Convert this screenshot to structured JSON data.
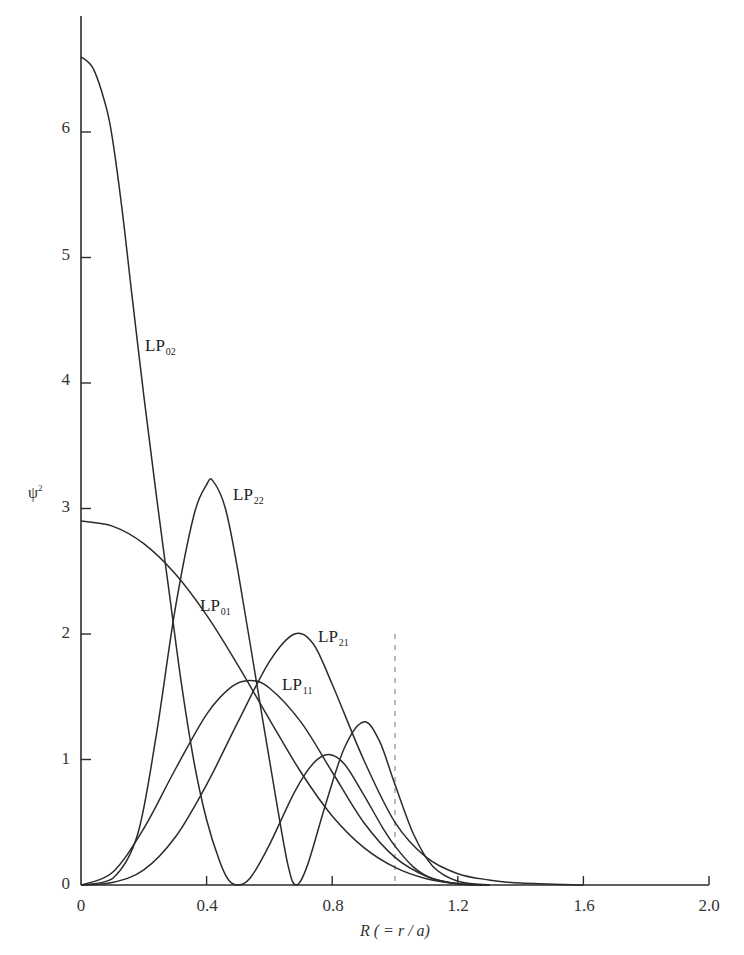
{
  "chart_data": {
    "type": "line",
    "title": "",
    "xlabel": "R (= r/a)",
    "ylabel": "ψ²",
    "xlim": [
      0,
      2.0
    ],
    "ylim": [
      0,
      6.6
    ],
    "grid": false,
    "legend": "inline labels",
    "x_ticks": [
      "0",
      "0.4",
      "0.8",
      "1.2",
      "1.6",
      "2.0"
    ],
    "y_ticks": [
      "0",
      "1",
      "2",
      "3",
      "4",
      "5",
      "6"
    ],
    "annotations": [
      {
        "type": "dashed-vertical-line",
        "x": 1.0,
        "y_top": 2.0,
        "meaning": "core boundary R = 1"
      }
    ],
    "series": [
      {
        "name": "LP01",
        "label_main": "LP",
        "label_sub": "01",
        "points": [
          [
            0,
            2.9
          ],
          [
            0.1,
            2.86
          ],
          [
            0.2,
            2.72
          ],
          [
            0.3,
            2.48
          ],
          [
            0.4,
            2.15
          ],
          [
            0.5,
            1.75
          ],
          [
            0.6,
            1.32
          ],
          [
            0.7,
            0.9
          ],
          [
            0.8,
            0.55
          ],
          [
            0.9,
            0.3
          ],
          [
            1.0,
            0.14
          ],
          [
            1.1,
            0.05
          ],
          [
            1.2,
            0.01
          ],
          [
            1.3,
            0
          ]
        ]
      },
      {
        "name": "LP02",
        "label_main": "LP",
        "label_sub": "02",
        "points": [
          [
            0,
            6.6
          ],
          [
            0.04,
            6.5
          ],
          [
            0.08,
            6.2
          ],
          [
            0.1,
            5.95
          ],
          [
            0.13,
            5.4
          ],
          [
            0.16,
            4.75
          ],
          [
            0.2,
            3.9
          ],
          [
            0.24,
            3.1
          ],
          [
            0.28,
            2.35
          ],
          [
            0.32,
            1.6
          ],
          [
            0.36,
            0.98
          ],
          [
            0.4,
            0.52
          ],
          [
            0.44,
            0.2
          ],
          [
            0.47,
            0.04
          ],
          [
            0.5,
            0
          ],
          [
            0.54,
            0.06
          ],
          [
            0.6,
            0.32
          ],
          [
            0.68,
            0.74
          ],
          [
            0.74,
            0.97
          ],
          [
            0.79,
            1.04
          ],
          [
            0.84,
            0.96
          ],
          [
            0.9,
            0.72
          ],
          [
            0.96,
            0.46
          ],
          [
            1.0,
            0.31
          ],
          [
            1.06,
            0.14
          ],
          [
            1.12,
            0.05
          ],
          [
            1.2,
            0.01
          ],
          [
            1.3,
            0
          ]
        ]
      },
      {
        "name": "LP11",
        "label_main": "LP",
        "label_sub": "11",
        "points": [
          [
            0,
            0
          ],
          [
            0.1,
            0.1
          ],
          [
            0.2,
            0.45
          ],
          [
            0.3,
            0.92
          ],
          [
            0.4,
            1.36
          ],
          [
            0.48,
            1.58
          ],
          [
            0.54,
            1.63
          ],
          [
            0.6,
            1.57
          ],
          [
            0.7,
            1.3
          ],
          [
            0.8,
            0.9
          ],
          [
            0.9,
            0.5
          ],
          [
            1.0,
            0.22
          ],
          [
            1.1,
            0.07
          ],
          [
            1.2,
            0.01
          ],
          [
            1.3,
            0
          ]
        ]
      },
      {
        "name": "LP21",
        "label_main": "LP",
        "label_sub": "21",
        "points": [
          [
            0,
            0
          ],
          [
            0.1,
            0.02
          ],
          [
            0.2,
            0.12
          ],
          [
            0.3,
            0.38
          ],
          [
            0.4,
            0.8
          ],
          [
            0.5,
            1.3
          ],
          [
            0.6,
            1.78
          ],
          [
            0.68,
            2.0
          ],
          [
            0.74,
            1.92
          ],
          [
            0.8,
            1.6
          ],
          [
            0.9,
            1.0
          ],
          [
            1.0,
            0.5
          ],
          [
            1.1,
            0.22
          ],
          [
            1.2,
            0.09
          ],
          [
            1.3,
            0.04
          ],
          [
            1.4,
            0.015
          ],
          [
            1.6,
            0
          ]
        ]
      },
      {
        "name": "LP22",
        "label_main": "LP",
        "label_sub": "22",
        "points": [
          [
            0,
            0
          ],
          [
            0.1,
            0.05
          ],
          [
            0.18,
            0.4
          ],
          [
            0.24,
            1.2
          ],
          [
            0.3,
            2.2
          ],
          [
            0.36,
            2.95
          ],
          [
            0.4,
            3.19
          ],
          [
            0.42,
            3.22
          ],
          [
            0.46,
            3.0
          ],
          [
            0.5,
            2.5
          ],
          [
            0.56,
            1.6
          ],
          [
            0.62,
            0.7
          ],
          [
            0.66,
            0.15
          ],
          [
            0.685,
            0
          ],
          [
            0.72,
            0.15
          ],
          [
            0.78,
            0.65
          ],
          [
            0.84,
            1.1
          ],
          [
            0.9,
            1.3
          ],
          [
            0.95,
            1.15
          ],
          [
            1.0,
            0.8
          ],
          [
            1.06,
            0.4
          ],
          [
            1.12,
            0.15
          ],
          [
            1.2,
            0.03
          ],
          [
            1.3,
            0
          ]
        ]
      }
    ]
  },
  "labels": {
    "y_axis_title_main": "ψ",
    "y_axis_title_sup": "2",
    "x_axis_title_var": "R",
    "x_axis_title_rest": " ( = r / a)",
    "curves": {
      "lp02": {
        "main": "LP",
        "sub": "02"
      },
      "lp22": {
        "main": "LP",
        "sub": "22"
      },
      "lp01": {
        "main": "LP",
        "sub": "01"
      },
      "lp21": {
        "main": "LP",
        "sub": "21"
      },
      "lp11": {
        "main": "LP",
        "sub": "11"
      }
    },
    "y_ticks": [
      "0",
      "1",
      "2",
      "3",
      "4",
      "5",
      "6"
    ],
    "x_ticks": [
      "0",
      "0.4",
      "0.8",
      "1.2",
      "1.6",
      "2.0"
    ]
  }
}
